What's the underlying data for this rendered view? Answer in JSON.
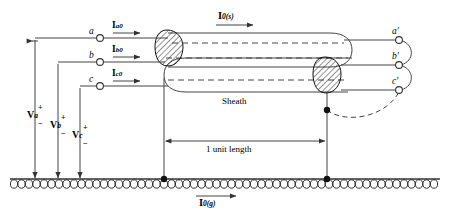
{
  "figure": {
    "ground_label": "ground-hatching"
  },
  "left_terminals": [
    {
      "name": "a",
      "current": "I",
      "current_sub": "a0"
    },
    {
      "name": "b",
      "current": "I",
      "current_sub": "b0"
    },
    {
      "name": "c",
      "current": "I",
      "current_sub": "c0"
    }
  ],
  "right_terminals": [
    {
      "name": "a′"
    },
    {
      "name": "b′"
    },
    {
      "name": "c′"
    }
  ],
  "voltages": [
    {
      "symbol": "V",
      "sub": "a",
      "plus": "+",
      "minus": "−"
    },
    {
      "symbol": "V",
      "sub": "b",
      "plus": "+",
      "minus": "−"
    },
    {
      "symbol": "V",
      "sub": "c",
      "plus": "+",
      "minus": "−"
    }
  ],
  "currents": {
    "sheath": {
      "symbol": "I",
      "sub": "0(s)"
    },
    "ground": {
      "symbol": "I",
      "sub": "0(g)"
    }
  },
  "annotations": {
    "sheath": "Sheath",
    "length": "1 unit length"
  },
  "colors": {
    "line": "#444444",
    "text": "#000000",
    "hatch": "#000000",
    "background": "#ffffff"
  }
}
